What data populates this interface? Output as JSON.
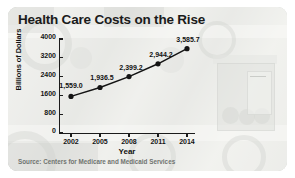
{
  "card": {
    "source_note": "Source: Centers for Medicare and Medicaid Services",
    "accent_color": "#1b1b1b",
    "panel_background": "#d8d9d6",
    "source_color": "#6f736f"
  },
  "chart_data": {
    "type": "line",
    "title": "Health Care Costs on the Rise",
    "xlabel": "Year",
    "ylabel": "Billions of Dollars",
    "categories": [
      "2002",
      "2005",
      "2008",
      "2011",
      "2014"
    ],
    "values": [
      1559.0,
      1936.5,
      2399.2,
      2944.2,
      3585.7
    ],
    "point_labels": [
      "1,559.0",
      "1,936.5",
      "2,399.2",
      "2,944.2",
      "3,585.7"
    ],
    "ylim": [
      0,
      4000
    ],
    "yticks": [
      0,
      800,
      1600,
      2400,
      3200,
      4000
    ],
    "ytick_labels": [
      "0",
      "800",
      "1600",
      "2400",
      "3200",
      "4000"
    ],
    "grid": false,
    "legend": "none",
    "series": [
      {
        "name": "National health expenditures",
        "values": [
          1559.0,
          1936.5,
          2399.2,
          2944.2,
          3585.7
        ]
      }
    ]
  }
}
